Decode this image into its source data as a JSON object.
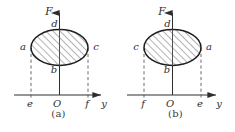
{
  "figure": {
    "background_color": "#ffffff",
    "stroke_color": "#2e2e2e",
    "hatch_color": "#4a4a4a",
    "dash_color": "#5a5a5a",
    "panels": [
      {
        "id": "a",
        "caption": "(a)",
        "axes": {
          "vertical_label": "F",
          "horizontal_label": "y",
          "origin_label": "O"
        },
        "ellipse_labels": {
          "top": "d",
          "bottom": "b",
          "left": "a",
          "right": "c"
        },
        "axis_ticks": {
          "left": "e",
          "right": "f"
        }
      },
      {
        "id": "b",
        "caption": "(b)",
        "axes": {
          "vertical_label": "F",
          "horizontal_label": "y",
          "origin_label": "O"
        },
        "ellipse_labels": {
          "top": "d",
          "bottom": "b",
          "left": "c",
          "right": "a"
        },
        "axis_ticks": {
          "left": "f",
          "right": "e"
        }
      }
    ]
  }
}
